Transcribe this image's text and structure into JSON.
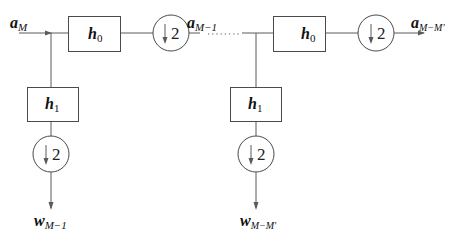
{
  "diagram": {
    "title": "",
    "input_signal": {
      "base": "a",
      "subscript": "M"
    },
    "intermediate_signal": {
      "base": "a",
      "subscript": "M−1"
    },
    "output_signal": {
      "base": "a",
      "subscript": "M−M′"
    },
    "stage1": {
      "lowpass_filter": {
        "base": "h",
        "subscript": "0"
      },
      "highpass_filter": {
        "base": "h",
        "subscript": "1"
      },
      "downsampler_main": {
        "factor": "2",
        "symbol": "↓"
      },
      "downsampler_branch": {
        "factor": "2",
        "symbol": "↓"
      },
      "detail_output": {
        "base": "w",
        "subscript": "M−1"
      }
    },
    "stage2": {
      "lowpass_filter": {
        "base": "h",
        "subscript": "0"
      },
      "highpass_filter": {
        "base": "h",
        "subscript": "1"
      },
      "downsampler_main": {
        "factor": "2",
        "symbol": "↓"
      },
      "downsampler_branch": {
        "factor": "2",
        "symbol": "↓"
      },
      "detail_output": {
        "base": "w",
        "subscript": "M−M′"
      }
    },
    "continuation": "......",
    "colors": {
      "line": "#5a5a5a",
      "text": "#111111",
      "background": "#ffffff"
    }
  }
}
